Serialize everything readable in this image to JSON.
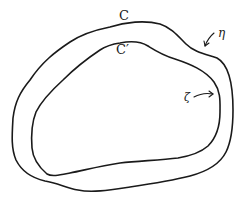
{
  "figure": {
    "type": "contour-diagram",
    "stroke_color": "#1a1a1a",
    "background": "#ffffff"
  },
  "labels": {
    "outer_curve": "C",
    "inner_curve": "C′",
    "point_on_outer": "η",
    "point_on_inner": "ζ"
  },
  "curves": {
    "outer": {
      "name": "C",
      "path": "M110,27 C125,22 145,20 160,24 C172,28 178,36 186,44 C194,52 205,54 217,58 C228,64 233,80 233,110 C233,130 231,142 226,152 C220,164 205,172 190,176 C170,181 150,184 130,187 C110,190 92,193 78,190 C66,188 58,183 45,181 C32,178 22,172 16,160 C11,148 12,135 13,118 C15,102 20,92 30,80 C42,62 55,52 70,42 C82,34 95,30 110,27 Z"
    },
    "inner": {
      "name": "C′",
      "path": "M120,43 C130,41 140,41 148,46 C156,51 162,55 175,59 C190,64 205,70 214,82 C221,92 220,102 220,112 C220,125 216,138 208,146 C200,153 190,156 178,158 C160,160 140,161 120,163 C100,166 85,170 70,173 C60,175 52,177 47,174 C40,168 33,160 32,148 C31,135 32,122 36,112 C42,100 52,90 63,80 C75,68 88,58 100,50 C106,46 113,44 120,43 Z"
    }
  },
  "arrows": {
    "eta": {
      "from": [
        214,
        33
      ],
      "to": [
        205,
        46
      ]
    },
    "zeta": {
      "from": [
        194,
        97
      ],
      "to": [
        213,
        94
      ]
    }
  }
}
